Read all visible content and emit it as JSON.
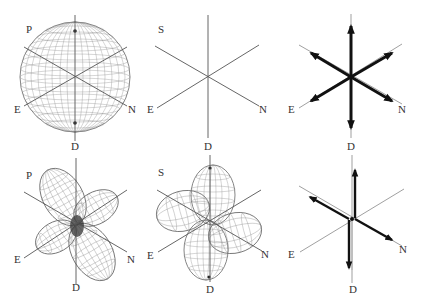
{
  "figure": {
    "panels": [
      {
        "id": "p-sphere",
        "title_label": "P",
        "description": "Spherical P-wave radiation pattern (isotropic source)",
        "axes": {
          "east": "E",
          "north": "N",
          "down": "D"
        }
      },
      {
        "id": "s-none",
        "title_label": "S",
        "description": "No S-wave radiation (isotropic source)",
        "axes": {
          "east": "E",
          "north": "N",
          "down": "D"
        }
      },
      {
        "id": "force-explosion",
        "description": "Equivalent forces: three orthogonal outward dipoles",
        "axes": {
          "east": "E",
          "north": "N",
          "down": "D"
        }
      },
      {
        "id": "p-quadrant",
        "title_label": "P",
        "description": "Four-lobed P-wave radiation pattern (double couple)",
        "axes": {
          "east": "E",
          "north": "N",
          "down": "D"
        }
      },
      {
        "id": "s-quadrant",
        "title_label": "S",
        "description": "Four-lobed S-wave radiation pattern (double couple)",
        "axes": {
          "east": "E",
          "north": "N",
          "down": "D"
        }
      },
      {
        "id": "force-double-couple",
        "description": "Equivalent forces: double couple",
        "axes": {
          "east": "E",
          "north": "N",
          "down": "D"
        }
      }
    ],
    "colors": {
      "axis": "#555555",
      "mesh": "#888888",
      "arrow": "#111111",
      "background": "#ffffff"
    }
  }
}
